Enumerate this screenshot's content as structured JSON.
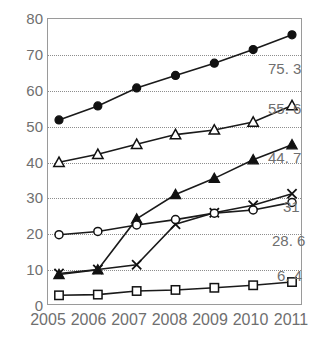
{
  "chart_data": {
    "type": "line",
    "title": "",
    "xlabel": "",
    "ylabel": "",
    "categories": [
      "2005",
      "2006",
      "2007",
      "2008",
      "2009",
      "2010",
      "2011"
    ],
    "ylim": [
      0,
      80
    ],
    "yticks": [
      0,
      10,
      20,
      30,
      40,
      50,
      60,
      70,
      80
    ],
    "grid": true,
    "legend_position": "none",
    "end_labels_position": "right",
    "series": [
      {
        "name": "series-filled-circle",
        "marker": "filled-circle",
        "values": [
          51.6,
          55.5,
          60.5,
          64.0,
          67.4,
          71.2,
          75.3
        ],
        "end_label": "75. 3"
      },
      {
        "name": "series-open-triangle",
        "marker": "open-triangle",
        "values": [
          39.8,
          42.0,
          44.8,
          47.5,
          48.8,
          51.0,
          55.6
        ],
        "end_label": "55. 6"
      },
      {
        "name": "series-filled-triangle",
        "marker": "filled-triangle",
        "values": [
          8.5,
          9.8,
          24.0,
          30.8,
          35.3,
          40.5,
          44.7
        ],
        "end_label": "44. 7"
      },
      {
        "name": "series-cross",
        "marker": "x-cross",
        "values": [
          8.8,
          9.9,
          11.2,
          22.5,
          25.7,
          27.8,
          31.0
        ],
        "end_label": "31"
      },
      {
        "name": "series-open-circle",
        "marker": "open-circle",
        "values": [
          19.6,
          20.5,
          22.3,
          23.8,
          25.6,
          26.5,
          28.6
        ],
        "end_label": "28. 6"
      },
      {
        "name": "series-open-square",
        "marker": "open-square",
        "values": [
          2.7,
          2.9,
          3.9,
          4.2,
          4.8,
          5.5,
          6.4
        ],
        "end_label": "6. 4"
      }
    ]
  },
  "axis": {
    "y_labels": [
      "80",
      "70",
      "60",
      "50",
      "40",
      "30",
      "20",
      "10",
      "0"
    ],
    "x_labels": [
      "2005",
      "2006",
      "2007",
      "2008",
      "2009",
      "2010",
      "2011"
    ]
  },
  "end_labels": [
    "75. 3",
    "55. 6",
    "44. 7",
    "31",
    "28. 6",
    "6. 4"
  ],
  "colors": {
    "ink": "#111111",
    "axis": "#9a9a9a",
    "grid": "#8d8d8d",
    "label_text": "#6f6f6f"
  }
}
